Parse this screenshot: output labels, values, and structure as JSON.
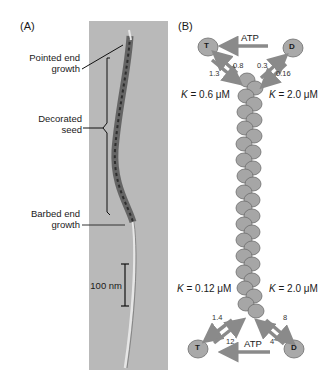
{
  "panel_a": {
    "label": "(A)",
    "annotations": {
      "pointed_end": [
        "Pointed end",
        "growth"
      ],
      "decorated_seed": [
        "Decorated",
        "seed"
      ],
      "barbed_end": [
        "Barbed end",
        "growth"
      ]
    },
    "scale_bar": "100 nm"
  },
  "panel_b": {
    "label": "(B)",
    "top": {
      "monomer_left": "T",
      "monomer_right": "D",
      "atp_label": "ATP",
      "rate_T_on": "1.3",
      "rate_T_off": "0.8",
      "rate_D_off": "0.3",
      "rate_D_on": "0.16",
      "k_left": "= 0.6 μM",
      "k_right": "= 2.0 μM",
      "k_symbol": "K"
    },
    "bottom": {
      "monomer_left": "T",
      "monomer_right": "D",
      "atp_label": "ATP",
      "rate_T_off": "1.4",
      "rate_T_on": "12",
      "rate_D_off": "8",
      "rate_D_on": "4",
      "k_left": "= 0.12 μM",
      "k_right": "= 2.0 μM",
      "k_symbol": "K"
    }
  },
  "colors": {
    "arrow": "#8a8a8a",
    "monomer": "#a9a9a9",
    "micrograph_bg": "#b9b9b9"
  }
}
